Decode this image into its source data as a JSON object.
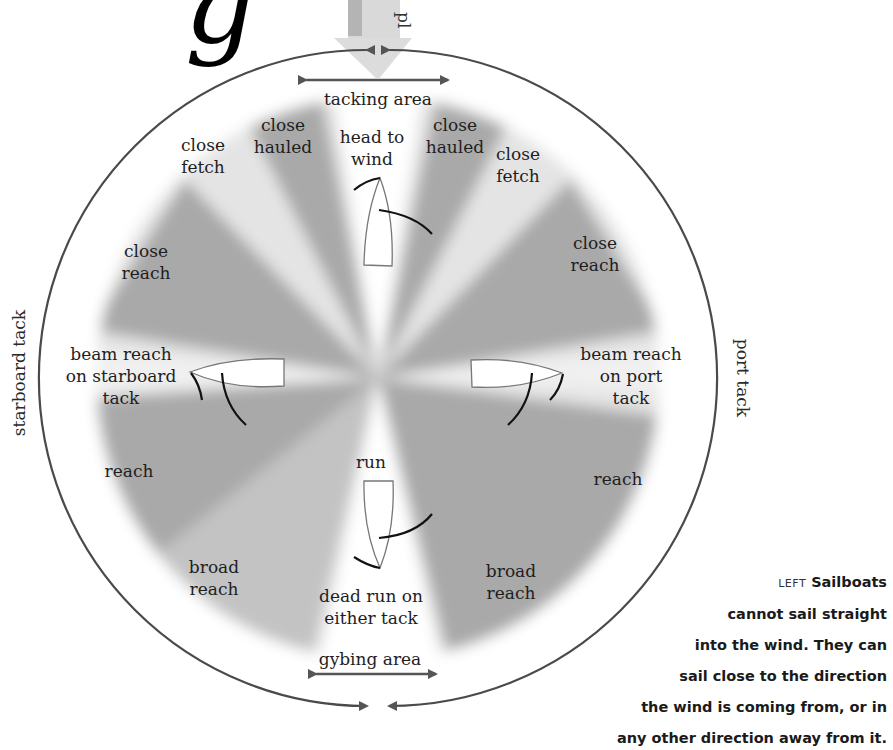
{
  "diagram": {
    "title_fragment": "g",
    "wind_arrow_text": "pl",
    "colors": {
      "sector_dark": "#a8a8a8",
      "sector_light": "#e3e3e3",
      "no_go_zone": "#ffffff",
      "circle_stroke": "#4a4a4a",
      "arrow_fill": "#555555",
      "wind_arrow": "#d6d6d6"
    },
    "areas": {
      "tacking": "tacking area",
      "gybing": "gybing area"
    },
    "side_labels": {
      "left": "starboard tack",
      "right": "port tack"
    },
    "points_of_sail": [
      {
        "id": "head-to-wind",
        "lines": [
          "head to",
          "wind"
        ]
      },
      {
        "id": "close-hauled-left",
        "lines": [
          "close",
          "hauled"
        ]
      },
      {
        "id": "close-hauled-right",
        "lines": [
          "close",
          "hauled"
        ]
      },
      {
        "id": "close-fetch-left",
        "lines": [
          "close",
          "fetch"
        ]
      },
      {
        "id": "close-fetch-right",
        "lines": [
          "close",
          "fetch"
        ]
      },
      {
        "id": "close-reach-left",
        "lines": [
          "close",
          "reach"
        ]
      },
      {
        "id": "close-reach-right",
        "lines": [
          "close",
          "reach"
        ]
      },
      {
        "id": "beam-reach-starboard",
        "lines": [
          "beam reach",
          "on starboard",
          "tack"
        ]
      },
      {
        "id": "beam-reach-port",
        "lines": [
          "beam reach",
          "on port",
          "tack"
        ]
      },
      {
        "id": "reach-left",
        "lines": [
          "reach"
        ]
      },
      {
        "id": "reach-right",
        "lines": [
          "reach"
        ]
      },
      {
        "id": "run",
        "lines": [
          "run"
        ]
      },
      {
        "id": "broad-reach-left",
        "lines": [
          "broad",
          "reach"
        ]
      },
      {
        "id": "broad-reach-right",
        "lines": [
          "broad",
          "reach"
        ]
      },
      {
        "id": "dead-run",
        "lines": [
          "dead run on",
          "either tack"
        ]
      }
    ],
    "boats": [
      "head-to-wind",
      "beam-reach-starboard",
      "beam-reach-port",
      "run"
    ]
  },
  "caption": {
    "prefix": "LEFT",
    "lines": [
      "Sailboats",
      "cannot sail straight",
      "into the wind. They can",
      "sail close to the direction",
      "the wind is coming from, or in",
      "any other direction away from it."
    ]
  }
}
